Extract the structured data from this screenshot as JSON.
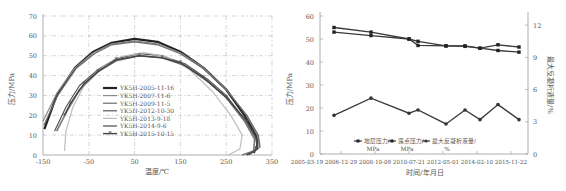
{
  "chart_data": [
    {
      "type": "line",
      "title": "",
      "xlabel": "温度/℃",
      "ylabel": "压力/MPa",
      "xlim": [
        -150,
        350
      ],
      "ylim": [
        0,
        70
      ],
      "xticks": [
        -150,
        -50,
        50,
        150,
        250,
        350
      ],
      "yticks": [
        0,
        10,
        20,
        30,
        40,
        50,
        60,
        70
      ],
      "grid": true,
      "legend_position": "center-left inside",
      "series": [
        {
          "name": "YK5H-2005-11-16",
          "color": "#222222",
          "width": 2.2,
          "marker": "none",
          "points": [
            [
              -147,
              13
            ],
            [
              -120,
              30
            ],
            [
              -80,
              44
            ],
            [
              -40,
              52
            ],
            [
              0,
              56.5
            ],
            [
              50,
              58.5
            ],
            [
              100,
              57
            ],
            [
              150,
              52
            ],
            [
              200,
              44
            ],
            [
              250,
              33
            ],
            [
              290,
              20
            ],
            [
              315,
              10
            ],
            [
              318,
              5
            ],
            [
              310,
              1
            ]
          ]
        },
        {
          "name": "YK5H-2007-11-6",
          "color": "#8a8a8a",
          "width": 1.2,
          "marker": "none",
          "points": [
            [
              -150,
              17
            ],
            [
              -120,
              31
            ],
            [
              -80,
              44
            ],
            [
              -40,
              51.5
            ],
            [
              0,
              56
            ],
            [
              50,
              57.5
            ],
            [
              100,
              56
            ],
            [
              150,
              51.5
            ],
            [
              200,
              44
            ],
            [
              250,
              33
            ],
            [
              295,
              20
            ],
            [
              318,
              10
            ],
            [
              322,
              5
            ],
            [
              305,
              1
            ]
          ]
        },
        {
          "name": "YK5H-2009-11-5",
          "color": "#6a6a6a",
          "width": 1.2,
          "marker": "none",
          "points": [
            [
              -148,
              15
            ],
            [
              -118,
              30
            ],
            [
              -78,
              43.5
            ],
            [
              -38,
              51
            ],
            [
              0,
              55.5
            ],
            [
              50,
              57
            ],
            [
              100,
              55.5
            ],
            [
              150,
              51
            ],
            [
              200,
              43.5
            ],
            [
              250,
              33
            ],
            [
              295,
              20
            ],
            [
              320,
              10
            ],
            [
              324,
              4
            ],
            [
              300,
              0
            ]
          ]
        },
        {
          "name": "YK5H-2012-10-30",
          "color": "#555555",
          "width": 1.2,
          "marker": "none",
          "points": [
            [
              -125,
              12
            ],
            [
              -100,
              24
            ],
            [
              -70,
              35
            ],
            [
              -30,
              43
            ],
            [
              10,
              48.5
            ],
            [
              60,
              51
            ],
            [
              110,
              50
            ],
            [
              160,
              46
            ],
            [
              210,
              38
            ],
            [
              250,
              30
            ],
            [
              290,
              18
            ],
            [
              316,
              8
            ],
            [
              318,
              3
            ],
            [
              295,
              0
            ]
          ]
        },
        {
          "name": "YK5H-2013-9-18",
          "color": "#bdbdbd",
          "width": 1.2,
          "marker": "none",
          "points": [
            [
              -103,
              2
            ],
            [
              -100,
              12
            ],
            [
              -85,
              24
            ],
            [
              -60,
              35
            ],
            [
              -20,
              44
            ],
            [
              20,
              49.5
            ],
            [
              70,
              51.5
            ],
            [
              120,
              49.5
            ],
            [
              170,
              43
            ],
            [
              220,
              32
            ],
            [
              260,
              20
            ],
            [
              285,
              10
            ],
            [
              280,
              3
            ],
            [
              255,
              0
            ]
          ]
        },
        {
          "name": "YK5H-2014-9-6",
          "color": "#777777",
          "width": 1.6,
          "marker": "none",
          "points": [
            [
              -120,
              12
            ],
            [
              -98,
              22
            ],
            [
              -70,
              33
            ],
            [
              -30,
              42
            ],
            [
              10,
              47.5
            ],
            [
              60,
              50
            ],
            [
              110,
              49
            ],
            [
              160,
              45
            ],
            [
              210,
              37
            ],
            [
              250,
              29
            ],
            [
              290,
              17
            ],
            [
              312,
              8
            ],
            [
              310,
              2
            ],
            [
              285,
              0
            ]
          ]
        },
        {
          "name": "YK5H-2015-10-15",
          "color": "#444444",
          "width": 1.4,
          "marker": "asterisk",
          "points": [
            [
              -103,
              20
            ],
            [
              -90,
              26
            ],
            [
              -60,
              36
            ],
            [
              -30,
              42
            ],
            [
              10,
              48
            ],
            [
              60,
              50
            ],
            [
              110,
              49
            ],
            [
              150,
              46.5
            ],
            [
              200,
              39
            ],
            [
              250,
              29
            ],
            [
              295,
              17
            ],
            [
              318,
              8
            ],
            [
              318,
              3
            ],
            [
              295,
              0
            ]
          ]
        }
      ]
    },
    {
      "type": "line",
      "title": "",
      "xlabel": "时间/年月日",
      "ylabel": "压力/MPa",
      "y2label": "最大反凝析液量/%",
      "ylim": [
        0,
        60
      ],
      "y2lim": [
        0,
        13.5
      ],
      "yticks": [
        0,
        10,
        20,
        30,
        40,
        50,
        60
      ],
      "y2ticks": [
        0,
        3,
        6,
        9,
        12
      ],
      "categories": [
        "2005-03-19",
        "2006-12-29",
        "2008-10-09",
        "2010-07-21",
        "2012-05-01",
        "2014-02-10",
        "2015-11-22"
      ],
      "grid": false,
      "legend_position": "bottom inside",
      "x_dates": [
        "2005-11-16",
        "2007-11-06",
        "2009-11-05",
        "2010-05",
        "2012-10-30",
        "2013-09-18",
        "2014-09-06",
        "2015-10-15",
        "2016-10"
      ],
      "series": [
        {
          "name": "地层压力/MPa",
          "axis": "left",
          "values": [
            55,
            53,
            50,
            49,
            47,
            47,
            46,
            47.5,
            46.5
          ]
        },
        {
          "name": "露点压力/MPa",
          "axis": "left",
          "values": [
            53,
            51.5,
            50,
            47.2,
            47,
            46.8,
            46,
            45,
            44.3
          ]
        },
        {
          "name": "最大反凝析液量/%",
          "axis": "right",
          "values": [
            3.6,
            5.2,
            3.8,
            4.1,
            2.8,
            4.1,
            3.2,
            4.6,
            3.2
          ]
        }
      ]
    }
  ],
  "left": {
    "xlabel": "温度/℃",
    "ylabel": "压力/MPa",
    "xticks": [
      "-150",
      "-50",
      "50",
      "150",
      "250",
      "350"
    ],
    "yticks": [
      "0",
      "10",
      "20",
      "30",
      "40",
      "50",
      "60",
      "70"
    ],
    "legend": [
      "YK5H-2005-11-16",
      "YK5H-2007-11-6",
      "YK5H-2009-11-5",
      "YK5H-2012-10-30",
      "YK5H-2013-9-18",
      "YK5H-2014-9-6",
      "YK5H-2015-10-15"
    ]
  },
  "right": {
    "xlabel": "时间/年月日",
    "ylabel": "压力/MPa",
    "y2label": "最大反凝析液量/%",
    "xticks": [
      "2005-03-19",
      "2006-12-29",
      "2008-10-09",
      "2010-07-21",
      "2012-05-01",
      "2014-02-10",
      "2015-11-22"
    ],
    "yticks": [
      "0",
      "10",
      "20",
      "30",
      "40",
      "50",
      "60"
    ],
    "y2ticks": [
      "0",
      "3",
      "6",
      "9",
      "12"
    ],
    "legend": [
      {
        "line1": "地层压力/",
        "line2": "MPa"
      },
      {
        "line1": "露点压力/",
        "line2": "MPa"
      },
      {
        "line1": "最大反凝析液量/",
        "line2": "%"
      }
    ]
  }
}
